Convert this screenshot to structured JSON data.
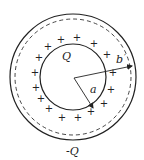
{
  "diagram": {
    "title": "",
    "colors": {
      "stroke": "#222222",
      "background": "#ffffff"
    },
    "inner_sphere": {
      "charge_label": "Q",
      "radius_label": "a",
      "surface_charge_sign": "+"
    },
    "outer_shell": {
      "charge_label": "-Q",
      "radius_label": "b",
      "radius_label_prime": "′"
    },
    "plus_marks": [
      {
        "x": 61,
        "y": 39
      },
      {
        "x": 77,
        "y": 37
      },
      {
        "x": 94,
        "y": 43
      },
      {
        "x": 107,
        "y": 54
      },
      {
        "x": 113,
        "y": 72
      },
      {
        "x": 111,
        "y": 89
      },
      {
        "x": 104,
        "y": 103
      },
      {
        "x": 91,
        "y": 111
      },
      {
        "x": 78,
        "y": 117
      },
      {
        "x": 62,
        "y": 117
      },
      {
        "x": 49,
        "y": 108
      },
      {
        "x": 41,
        "y": 98
      },
      {
        "x": 36,
        "y": 87
      },
      {
        "x": 35,
        "y": 72
      },
      {
        "x": 39,
        "y": 57
      },
      {
        "x": 48,
        "y": 46
      }
    ]
  }
}
